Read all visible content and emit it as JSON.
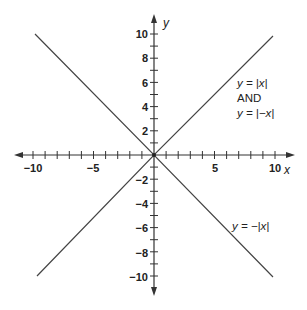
{
  "chart_data": {
    "type": "line",
    "title": "",
    "xlabel": "x",
    "ylabel": "y",
    "xlim": [
      -10,
      10
    ],
    "ylim": [
      -10,
      10
    ],
    "grid": false,
    "x_ticks": [
      -10,
      -5,
      5,
      10
    ],
    "y_ticks": [
      -10,
      -8,
      -6,
      -4,
      -2,
      2,
      4,
      6,
      8,
      10
    ],
    "minor_tick_step": 1,
    "series": [
      {
        "name": "y = |x| AND y = |-x|",
        "x": [
          -10,
          0,
          10
        ],
        "y": [
          10,
          0,
          10
        ]
      },
      {
        "name": "y = -|x|",
        "x": [
          -10,
          0,
          10
        ],
        "y": [
          -10,
          0,
          -10
        ]
      }
    ],
    "annotations": [
      {
        "text": "y = |x|",
        "x": 7.5,
        "y": 5.5
      },
      {
        "text": "AND",
        "x": 7.5,
        "y": 4.3
      },
      {
        "text": "y = |−x|",
        "x": 7.5,
        "y": 3.1
      },
      {
        "text": "y = −|x|",
        "x": 7.5,
        "y": -6
      }
    ]
  },
  "labels": {
    "x_axis": "x",
    "y_axis": "y",
    "x_ticks": [
      "−10",
      "−5",
      "5",
      "10"
    ],
    "y_ticks_pos": [
      "10",
      "8",
      "6",
      "4",
      "2"
    ],
    "y_ticks_neg": [
      "−2",
      "−4",
      "−6",
      "−8",
      "−10"
    ],
    "ann_abs_x": "y = |x|",
    "ann_and": "AND",
    "ann_abs_negx": "y = |−x|",
    "ann_neg_abs_x": "y = −|x|"
  }
}
